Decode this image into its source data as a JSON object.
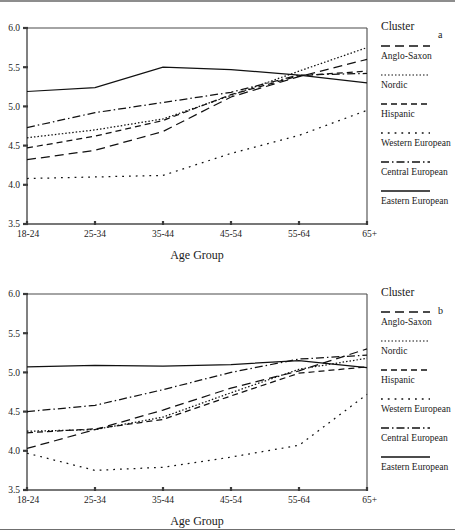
{
  "figure": {
    "panels": [
      "a",
      "b"
    ],
    "legend_title": "Cluster",
    "axis_title": "Age Group"
  },
  "legend": {
    "title": "Cluster",
    "items": [
      {
        "label": "Anglo-Saxon",
        "dash": "9,5",
        "width": 1.3
      },
      {
        "label": "Nordic",
        "dash": "1.5,2",
        "width": 1.2
      },
      {
        "label": "Hispanic",
        "dash": "6,4",
        "width": 1.3
      },
      {
        "label": "Western European",
        "dash": "1.8,5",
        "width": 1.3
      },
      {
        "label": "Central European",
        "dash": "8,3,1.5,3",
        "width": 1.3
      },
      {
        "label": "Eastern European",
        "dash": "0",
        "width": 1.3
      }
    ]
  },
  "chart_data": [
    {
      "type": "line",
      "panel": "a",
      "title": "a",
      "xlabel": "Age Group",
      "ylabel": "",
      "categories": [
        "18-24",
        "25-34",
        "35-44",
        "45-54",
        "55-64",
        "65+"
      ],
      "ylim": [
        3.5,
        6.0
      ],
      "yticks": [
        "3.5",
        "4.0",
        "4.5",
        "5.0",
        "5.5",
        "6.0"
      ],
      "grid": false,
      "legend_position": "right",
      "series": [
        {
          "name": "Anglo-Saxon",
          "values": [
            4.32,
            4.44,
            4.68,
            5.12,
            5.38,
            5.6
          ]
        },
        {
          "name": "Nordic",
          "values": [
            4.6,
            4.7,
            4.84,
            5.14,
            5.45,
            5.75
          ]
        },
        {
          "name": "Hispanic",
          "values": [
            4.47,
            4.62,
            4.82,
            5.15,
            5.39,
            5.45
          ]
        },
        {
          "name": "Western European",
          "values": [
            4.08,
            4.1,
            4.12,
            4.4,
            4.63,
            4.95
          ]
        },
        {
          "name": "Central European",
          "values": [
            4.73,
            4.92,
            5.05,
            5.18,
            5.4,
            5.42
          ]
        },
        {
          "name": "Eastern European",
          "values": [
            5.19,
            5.24,
            5.5,
            5.47,
            5.4,
            5.3
          ]
        }
      ]
    },
    {
      "type": "line",
      "panel": "b",
      "title": "b",
      "xlabel": "Age Group",
      "ylabel": "",
      "categories": [
        "18-24",
        "25-34",
        "35-44",
        "45-54",
        "55-64",
        "65+"
      ],
      "ylim": [
        3.5,
        6.0
      ],
      "yticks": [
        "3.5",
        "4.0",
        "4.5",
        "5.0",
        "5.5",
        "6.0"
      ],
      "grid": false,
      "legend_position": "right",
      "series": [
        {
          "name": "Anglo-Saxon",
          "values": [
            4.03,
            4.27,
            4.52,
            4.8,
            5.02,
            5.3
          ]
        },
        {
          "name": "Nordic",
          "values": [
            4.25,
            4.27,
            4.43,
            4.74,
            5.04,
            5.18
          ]
        },
        {
          "name": "Hispanic",
          "values": [
            4.23,
            4.28,
            4.4,
            4.7,
            4.99,
            5.07
          ]
        },
        {
          "name": "Western European",
          "values": [
            3.97,
            3.75,
            3.79,
            3.92,
            4.07,
            4.72
          ]
        },
        {
          "name": "Central European",
          "values": [
            4.5,
            4.58,
            4.78,
            5.0,
            5.17,
            5.22
          ]
        },
        {
          "name": "Eastern European",
          "values": [
            5.07,
            5.09,
            5.08,
            5.1,
            5.15,
            5.06
          ]
        }
      ]
    }
  ]
}
